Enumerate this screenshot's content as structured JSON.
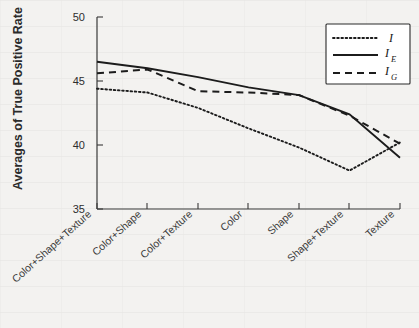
{
  "chart_data": {
    "type": "line",
    "title": "",
    "xlabel": "",
    "ylabel": "Averages of True Positive Rate",
    "ylim": [
      35,
      50
    ],
    "yticks": [
      35,
      40,
      45,
      50
    ],
    "grid": false,
    "legend_position": "top-right",
    "categories": [
      "Color+Shape+Texture",
      "Color+Shape",
      "Color+Texture",
      "Color",
      "Shape",
      "Shape+Texture",
      "Texture"
    ],
    "series": [
      {
        "name": "I",
        "style": "dotted",
        "values": [
          44.4,
          44.1,
          42.9,
          41.3,
          39.8,
          38.0,
          40.2
        ]
      },
      {
        "name": "I_E",
        "style": "solid",
        "values": [
          46.5,
          46.0,
          45.3,
          44.5,
          43.9,
          42.4,
          39.0
        ]
      },
      {
        "name": "I_G",
        "style": "dashed",
        "values": [
          45.6,
          45.9,
          44.2,
          44.1,
          43.9,
          42.3,
          40.1
        ]
      }
    ]
  },
  "axes": {
    "y_tick_labels": [
      "50",
      "45",
      "40",
      "35"
    ],
    "y_axis_title": "Averages of True Positive Rate"
  },
  "legend": {
    "entries": [
      {
        "base": "I",
        "sub": "",
        "style": "dotted"
      },
      {
        "base": "I",
        "sub": "E",
        "style": "solid"
      },
      {
        "base": "I",
        "sub": "G",
        "style": "dashed"
      }
    ]
  }
}
